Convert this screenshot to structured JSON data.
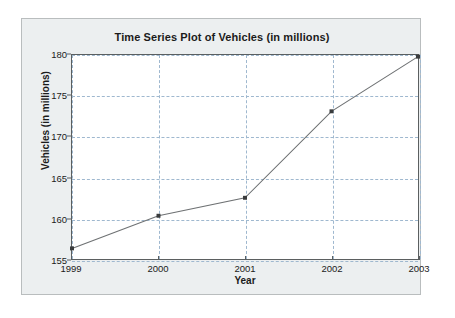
{
  "chart_data": {
    "type": "line",
    "title": "Time Series Plot of Vehicles (in millions)",
    "xlabel": "Year",
    "ylabel": "Vehicles (in millions)",
    "x": [
      1999,
      2000,
      2001,
      2002,
      2003
    ],
    "categories": [
      "1999",
      "2000",
      "2001",
      "2002",
      "2003"
    ],
    "values": [
      156.3,
      160.3,
      162.5,
      173.1,
      179.8
    ],
    "series": [
      {
        "name": "Vehicles",
        "values": [
          156.3,
          160.3,
          162.5,
          173.1,
          179.8
        ]
      }
    ],
    "xlim": [
      1999,
      2003
    ],
    "ylim": [
      155,
      180
    ],
    "ytick_labels": [
      "155",
      "160",
      "165",
      "170",
      "175",
      "180"
    ],
    "ytick_values": [
      155,
      160,
      165,
      170,
      175,
      180
    ],
    "xtick_labels": [
      "1999",
      "2000",
      "2001",
      "2002",
      "2003"
    ],
    "xtick_values": [
      1999,
      2000,
      2001,
      2002,
      2003
    ],
    "grid": true,
    "grid_style": "dashed",
    "legend": false,
    "legend_position": "none",
    "marker": "square",
    "colors": {
      "line": "#6e7173",
      "marker": "#3a3c3d",
      "grid": "#9fb8cf",
      "axis": "#5b5f60",
      "plot_background": "#ffffff",
      "panel_background": "#eceff0",
      "figure_background": "#ffffff",
      "text": "#1b1b1b"
    }
  }
}
